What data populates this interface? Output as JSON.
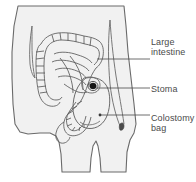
{
  "figure": {
    "background_color": "#ffffff",
    "body_fill": "#f2f2f2",
    "outline_color": "#595959",
    "label_color": "#4a4a4a",
    "stoma_color": "#1a1a1a"
  },
  "labels": [
    {
      "id": "large-intestine",
      "text": "Large\nintestine",
      "leader_line": {
        "x1": 97,
        "y1": 59,
        "x2": 150,
        "y2": 59
      }
    },
    {
      "id": "stoma",
      "text": "Stoma",
      "leader_line": {
        "x1": 96,
        "y1": 88,
        "x2": 150,
        "y2": 88
      }
    },
    {
      "id": "colostomy-bag",
      "text": "Colostomy\nbag",
      "leader_line": {
        "x1": 100,
        "y1": 115,
        "x2": 150,
        "y2": 115
      }
    }
  ],
  "parts": [
    {
      "id": "body-outline",
      "name": "torso and legs outline"
    },
    {
      "id": "large-intestine",
      "name": "large intestine coiled tube"
    },
    {
      "id": "stoma",
      "name": "stoma opening on abdomen"
    },
    {
      "id": "colostomy-bag",
      "name": "colostomy pouch attached at stoma"
    },
    {
      "id": "navel",
      "name": "navel"
    }
  ]
}
